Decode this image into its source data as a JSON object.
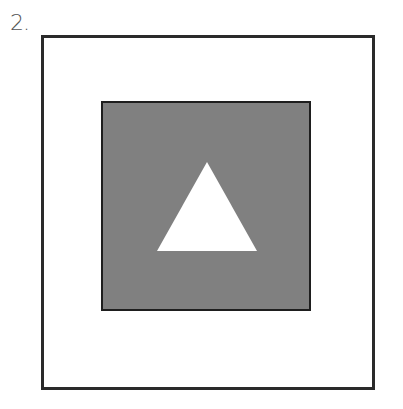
{
  "figure": {
    "number_label": "2.",
    "outer_square": {
      "x": 41,
      "y": 35,
      "size": 333,
      "stroke": "#2a2a2a",
      "fill": "#ffffff"
    },
    "inner_square": {
      "x": 102,
      "y": 102,
      "size": 208,
      "stroke": "#1e1e1e",
      "fill": "#808080"
    },
    "triangle": {
      "points": "207,162 157,251 257,251",
      "fill": "#ffffff"
    }
  }
}
